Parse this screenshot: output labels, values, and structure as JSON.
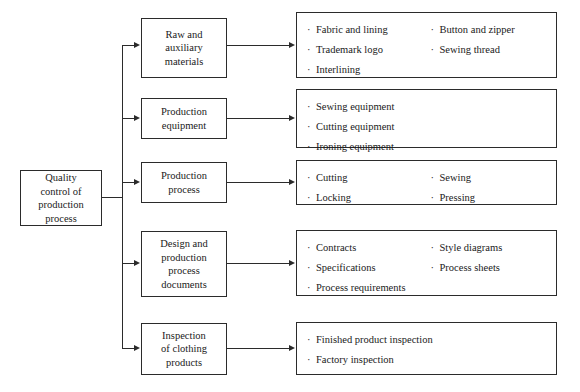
{
  "diagram": {
    "root": {
      "label": "Quality\ncontrol of\nproduction\nprocess"
    },
    "bullet_glyph": "·",
    "branches": [
      {
        "node_label": "Raw and\nauxiliary\nmaterials",
        "details_col1": [
          "Fabric and lining",
          "Trademark logo",
          "Interlining"
        ],
        "details_col2": [
          "Button and zipper",
          "Sewing thread"
        ]
      },
      {
        "node_label": "Production\nequipment",
        "details_col1": [
          "Sewing equipment",
          "Cutting equipment",
          "Ironing equipment"
        ],
        "details_col2": []
      },
      {
        "node_label": "Production\nprocess",
        "details_col1": [
          "Cutting",
          "Locking"
        ],
        "details_col2": [
          "Sewing",
          "Pressing"
        ]
      },
      {
        "node_label": "Design and\nproduction\nprocess\ndocuments",
        "details_col1": [
          "Contracts",
          "Specifications",
          "Process requirements"
        ],
        "details_col2": [
          "Style diagrams",
          "Process sheets"
        ]
      },
      {
        "node_label": "Inspection\nof clothing\nproducts",
        "details_col1": [
          "Finished product inspection",
          "Factory inspection"
        ],
        "details_col2": []
      }
    ],
    "colors": {
      "stroke": "#2b2b2b",
      "background": "#ffffff",
      "text": "#1a1a1a"
    }
  }
}
